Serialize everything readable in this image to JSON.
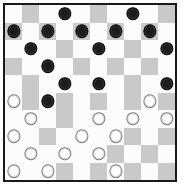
{
  "board": {
    "title": "International Draughts Board",
    "rows": 10,
    "cols": 10,
    "light_square_color": "#fcfcfc",
    "dark_square_color": "#c9c9c9",
    "border_color": "#1a1a1a",
    "background_color": "#ffffff",
    "black_piece_color": "#1c1c1c",
    "white_piece_color": "#fefefe",
    "black_piece_count": 18,
    "white_piece_count": 17,
    "squares": [
      [
        "light",
        "dark",
        "light",
        "light",
        "light",
        "dark",
        "light",
        "light",
        "light",
        "dark"
      ],
      [
        "dark",
        "light",
        "dark",
        "light",
        "dark",
        "light",
        "dark",
        "light",
        "dark",
        "light"
      ],
      [
        "light",
        "light",
        "light",
        "dark",
        "light",
        "light",
        "light",
        "dark",
        "light",
        "light"
      ],
      [
        "dark",
        "light",
        "light",
        "light",
        "dark",
        "light",
        "dark",
        "light",
        "dark",
        "light"
      ],
      [
        "light",
        "dark",
        "light",
        "light",
        "light",
        "light",
        "light",
        "dark",
        "light",
        "light"
      ],
      [
        "light",
        "dark",
        "light",
        "dark",
        "light",
        "dark",
        "light",
        "dark",
        "light",
        "dark"
      ],
      [
        "light",
        "light",
        "light",
        "dark",
        "light",
        "light",
        "light",
        "light",
        "light",
        "light"
      ],
      [
        "light",
        "light",
        "dark",
        "light",
        "light",
        "light",
        "light",
        "dark",
        "light",
        "dark"
      ],
      [
        "light",
        "light",
        "light",
        "light",
        "light",
        "light",
        "dark",
        "light",
        "dark",
        "light"
      ],
      [
        "light",
        "light",
        "light",
        "dark",
        "light",
        "dark",
        "light",
        "dark",
        "light",
        "dark"
      ]
    ],
    "pieces": [
      [
        null,
        null,
        null,
        "black",
        null,
        null,
        null,
        "black",
        null,
        null
      ],
      [
        "black",
        null,
        "black",
        null,
        "black",
        null,
        "black",
        null,
        "black",
        null
      ],
      [
        null,
        "black",
        null,
        null,
        null,
        "black",
        null,
        null,
        null,
        "black"
      ],
      [
        null,
        null,
        "black",
        null,
        null,
        null,
        null,
        null,
        null,
        null
      ],
      [
        null,
        null,
        null,
        "black",
        null,
        "black",
        null,
        null,
        null,
        "black"
      ],
      [
        "white",
        null,
        "black",
        null,
        null,
        null,
        null,
        null,
        "white",
        null
      ],
      [
        null,
        "white",
        null,
        null,
        null,
        "white",
        null,
        "white",
        null,
        "white"
      ],
      [
        "white",
        null,
        null,
        null,
        "white",
        null,
        "white",
        null,
        null,
        null
      ],
      [
        null,
        "white",
        null,
        "white",
        null,
        "white",
        null,
        null,
        null,
        null
      ],
      [
        "white",
        null,
        "white",
        null,
        null,
        null,
        "white",
        null,
        null,
        null
      ]
    ]
  }
}
